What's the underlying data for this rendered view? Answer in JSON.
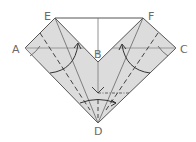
{
  "diagram": {
    "type": "origami-fold-step",
    "labels": {
      "A": "A",
      "B": "B",
      "C": "C",
      "D": "D",
      "E": "E",
      "F": "F"
    },
    "colors": {
      "paper": "#dcdcdc",
      "outline": "#555555",
      "fold_line": "#666666",
      "label": "#6a6a6a"
    },
    "points": {
      "E": [
        55,
        18
      ],
      "F": [
        143,
        18
      ],
      "A": [
        25,
        48
      ],
      "C": [
        176,
        48
      ],
      "B": [
        98,
        62
      ],
      "D": [
        98,
        123
      ]
    }
  }
}
